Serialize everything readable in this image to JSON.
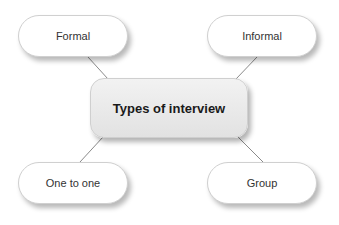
{
  "diagram": {
    "center": {
      "label": "Types of interview"
    },
    "nodes": [
      {
        "id": "formal",
        "label": "Formal"
      },
      {
        "id": "informal",
        "label": "Informal"
      },
      {
        "id": "one-to-one",
        "label": "One to one"
      },
      {
        "id": "group",
        "label": "Group"
      }
    ],
    "edges": [
      {
        "from": "Types of interview",
        "to": "Formal"
      },
      {
        "from": "Types of interview",
        "to": "Informal"
      },
      {
        "from": "Types of interview",
        "to": "One to one"
      },
      {
        "from": "Types of interview",
        "to": "Group"
      }
    ]
  }
}
